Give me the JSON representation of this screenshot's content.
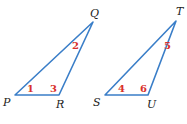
{
  "colors": {
    "stroke": "#3a7ec8",
    "angle_label": "#d9312b",
    "vertex_label": "#222222"
  },
  "triangles": [
    {
      "name": "PQR",
      "vertices": {
        "P": {
          "label": "P",
          "x": 15,
          "y": 95
        },
        "Q": {
          "label": "Q",
          "x": 93,
          "y": 22
        },
        "R": {
          "label": "R",
          "x": 59,
          "y": 95
        }
      },
      "angles": [
        {
          "label": "1",
          "at": "P"
        },
        {
          "label": "2",
          "at": "Q"
        },
        {
          "label": "3",
          "at": "R"
        }
      ]
    },
    {
      "name": "STU",
      "vertices": {
        "S": {
          "label": "S",
          "x": 105,
          "y": 95
        },
        "T": {
          "label": "T",
          "x": 176,
          "y": 21
        },
        "U": {
          "label": "U",
          "x": 148,
          "y": 95
        }
      },
      "angles": [
        {
          "label": "4",
          "at": "S"
        },
        {
          "label": "5",
          "at": "T"
        },
        {
          "label": "6",
          "at": "U"
        }
      ]
    }
  ]
}
